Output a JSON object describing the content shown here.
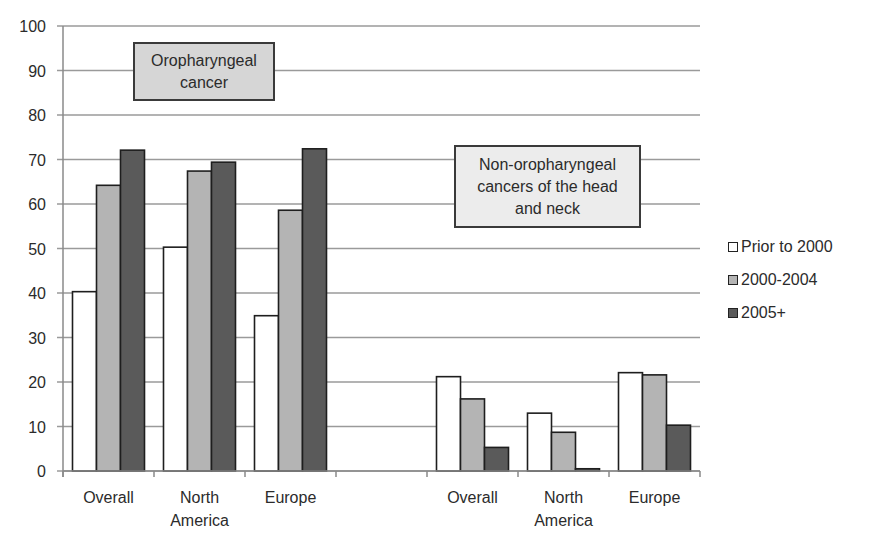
{
  "chart_data": {
    "type": "bar",
    "title": "",
    "xlabel": "",
    "ylabel": "",
    "ylim": [
      0,
      100
    ],
    "yticks": [
      0,
      10,
      20,
      30,
      40,
      50,
      60,
      70,
      80,
      90,
      100
    ],
    "grid": true,
    "legend_position": "right",
    "categories": [
      "Overall",
      "North America",
      "Europe",
      "",
      "Overall",
      "North America",
      "Europe"
    ],
    "groups": [
      {
        "label": "Oropharyngeal cancer",
        "categories": [
          "Overall",
          "North America",
          "Europe"
        ]
      },
      {
        "label": "Non-oropharyngeal cancers of the head and neck",
        "categories": [
          "Overall",
          "North America",
          "Europe"
        ]
      }
    ],
    "series": [
      {
        "name": "Prior to 2000",
        "color": "#ffffff",
        "values": [
          40.3,
          50.3,
          34.9,
          null,
          21.2,
          13.0,
          22.1
        ]
      },
      {
        "name": "2000-2004",
        "color": "#b4b4b4",
        "values": [
          64.2,
          67.4,
          58.6,
          null,
          16.2,
          8.7,
          21.6
        ]
      },
      {
        "name": "2005+",
        "color": "#5a5a5a",
        "values": [
          72.1,
          69.4,
          72.4,
          null,
          5.3,
          0.5,
          10.3
        ]
      }
    ],
    "annotations": [
      {
        "text": "Oropharyngeal cancer",
        "position": "top-left"
      },
      {
        "text": "Non-oropharyngeal cancers of the head and neck",
        "position": "middle-right"
      }
    ]
  },
  "annotations": {
    "oro_line1": "Oropharyngeal",
    "oro_line2": "cancer",
    "nonoro_line1": "Non-oropharyngeal",
    "nonoro_line2": "cancers of the head",
    "nonoro_line3": "and neck"
  },
  "legend": {
    "items": [
      {
        "label": "Prior to 2000",
        "color": "#ffffff"
      },
      {
        "label": "2000-2004",
        "color": "#b4b4b4"
      },
      {
        "label": "2005+",
        "color": "#5a5a5a"
      }
    ]
  },
  "axis": {
    "x_labels": [
      {
        "line1": "Overall",
        "line2": ""
      },
      {
        "line1": "North",
        "line2": "America"
      },
      {
        "line1": "Europe",
        "line2": ""
      },
      {
        "line1": "",
        "line2": ""
      },
      {
        "line1": "Overall",
        "line2": ""
      },
      {
        "line1": "North",
        "line2": "America"
      },
      {
        "line1": "Europe",
        "line2": ""
      }
    ]
  }
}
